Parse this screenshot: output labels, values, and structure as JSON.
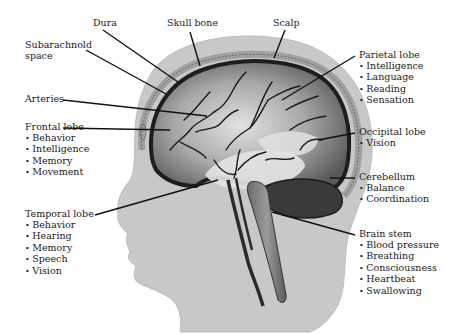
{
  "labels": {
    "dura": {
      "title": "Dura"
    },
    "skull_bone": {
      "title": "Skull bone"
    },
    "scalp": {
      "title": "Scalp"
    },
    "subarachnoid": {
      "title_line1": "Subarachnold",
      "title_line2": "space"
    },
    "arteries": {
      "title": "Arteries"
    },
    "parietal": {
      "title": "Parietal lobe",
      "items": [
        "Intelligence",
        "Language",
        "Reading",
        "Sensation"
      ]
    },
    "frontal": {
      "title": "Frontal lobe",
      "items": [
        "Behavior",
        "Intelligence",
        "Memory",
        "Movement"
      ]
    },
    "occipital": {
      "title": "Occipital lobe",
      "items": [
        "Vision"
      ]
    },
    "cerebellum": {
      "title": "Cerebellum",
      "items": [
        "Balance",
        "Coordination"
      ]
    },
    "temporal": {
      "title": "Temporal lobe",
      "items": [
        "Behavior",
        "Hearing",
        "Memory",
        "Speech",
        "Vision"
      ]
    },
    "brain_stem": {
      "title": "Brain stem",
      "items": [
        "Blood pressure",
        "Breathing",
        "Consciousness",
        "Heartbeat",
        "Swallowing"
      ]
    }
  },
  "colors": {
    "head": "#c8c8c8",
    "skull_ring": "#b4b4b4",
    "brain_outline": "#1e1e1e",
    "brain_fill": "#8c8c8c",
    "brain_light": "#d8d8d8",
    "cerebellum": "#3a3a3a",
    "leader_line": "#111111"
  }
}
